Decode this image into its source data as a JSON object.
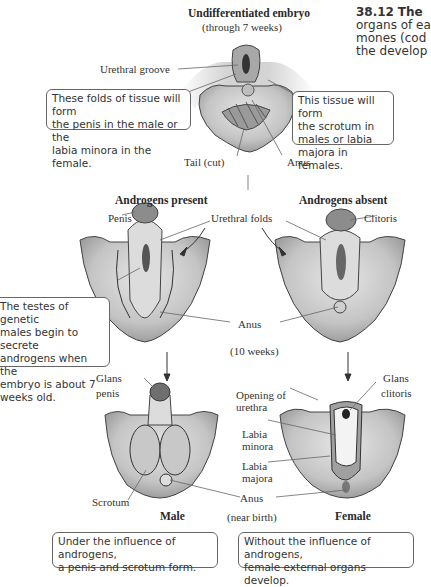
{
  "figure": {
    "number": "38.12",
    "caption_lines": [
      "The",
      "organs of ea",
      "mones (cod",
      "the develop"
    ]
  },
  "stages": {
    "embryo": {
      "title": "Undifferentiated embryo",
      "subtitle": "(through 7 weeks)"
    },
    "present": {
      "title": "Androgens present"
    },
    "absent": {
      "title": "Androgens absent"
    },
    "ten_weeks": "(10 weeks)",
    "near_birth": "(near birth)",
    "male": "Male",
    "female": "Female"
  },
  "labels": {
    "urethral_groove": "Urethral groove",
    "tail_cut": "Tail (cut)",
    "anus_top": "Anus",
    "penis": "Penis",
    "urethral_folds": "Urethral folds",
    "clitoris": "Clitoris",
    "anus_mid": "Anus",
    "glans_penis_1": "Glans",
    "glans_penis_2": "penis",
    "glans_clitoris_1": "Glans",
    "glans_clitoris_2": "clitoris",
    "opening_urethra_1": "Opening of",
    "opening_urethra_2": "urethra",
    "labia_minora_1": "Labia",
    "labia_minora_2": "minora",
    "labia_majora_1": "Labia",
    "labia_majora_2": "majora",
    "scrotum": "Scrotum",
    "anus_bottom": "Anus"
  },
  "callouts": {
    "folds": [
      "These folds of tissue will form",
      "the penis in the male or the",
      "labia minora in the female."
    ],
    "tissue": [
      "This tissue will form",
      "the scrotum in",
      "males or labia",
      "majora in females."
    ],
    "testes": [
      "The testes of genetic",
      "males begin to secrete",
      "androgens when the",
      "embryo is about 7",
      "weeks old."
    ],
    "male_result": [
      "Under the influence of androgens,",
      "a penis and scrotum form."
    ],
    "female_result": [
      "Without the influence of androgens,",
      "female external organs develop."
    ]
  },
  "colors": {
    "tissue": "#c9c9c9",
    "tissue_dark": "#8a8a8a",
    "outline": "#3a3a3a",
    "box_border": "#666666"
  }
}
